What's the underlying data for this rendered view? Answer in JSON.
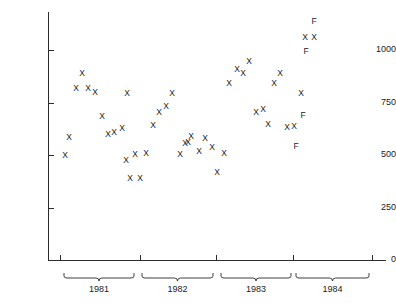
{
  "chart_data": {
    "type": "scatter",
    "title": "",
    "xlabel": "",
    "ylabel": "Monthly sales (millions of dollars)",
    "ylim": [
      0,
      1150
    ],
    "yticks": [
      0,
      250,
      500,
      750,
      1000
    ],
    "ytick_labels": [
      "0",
      "250",
      "500",
      "750",
      "1000"
    ],
    "grid": false,
    "legend": null,
    "x_groups": [
      {
        "label": "1981",
        "start_px": 63,
        "end_px": 135
      },
      {
        "label": "1982",
        "start_px": 141,
        "end_px": 214
      },
      {
        "label": "1983",
        "start_px": 220,
        "end_px": 292
      },
      {
        "label": "1984",
        "start_px": 295,
        "end_px": 370
      }
    ],
    "x_tick_px": [
      60,
      140,
      216,
      293,
      372
    ],
    "marker_symbols": {
      "actual": "X",
      "forecast": "F"
    },
    "points": [
      {
        "px": 65,
        "value": 500,
        "symbol": "X",
        "year": "1981"
      },
      {
        "px": 69,
        "value": 585,
        "symbol": "X",
        "year": "1981"
      },
      {
        "px": 76,
        "value": 820,
        "symbol": "X",
        "year": "1981"
      },
      {
        "px": 82,
        "value": 890,
        "symbol": "X",
        "year": "1981"
      },
      {
        "px": 88,
        "value": 820,
        "symbol": "X",
        "year": "1981"
      },
      {
        "px": 95,
        "value": 800,
        "symbol": "X",
        "year": "1981"
      },
      {
        "px": 102,
        "value": 685,
        "symbol": "X",
        "year": "1981"
      },
      {
        "px": 108,
        "value": 600,
        "symbol": "X",
        "year": "1981"
      },
      {
        "px": 114,
        "value": 610,
        "symbol": "X",
        "year": "1981"
      },
      {
        "px": 122,
        "value": 630,
        "symbol": "X",
        "year": "1981"
      },
      {
        "px": 127,
        "value": 795,
        "symbol": "X",
        "year": "1981"
      },
      {
        "px": 126,
        "value": 475,
        "symbol": "X",
        "year": "1981"
      },
      {
        "px": 130,
        "value": 390,
        "symbol": "X",
        "year": "1981"
      },
      {
        "px": 135,
        "value": 505,
        "symbol": "X",
        "year": "1982"
      },
      {
        "px": 140,
        "value": 390,
        "symbol": "X",
        "year": "1982"
      },
      {
        "px": 146,
        "value": 510,
        "symbol": "X",
        "year": "1982"
      },
      {
        "px": 153,
        "value": 645,
        "symbol": "X",
        "year": "1982"
      },
      {
        "px": 159,
        "value": 705,
        "symbol": "X",
        "year": "1982"
      },
      {
        "px": 166,
        "value": 735,
        "symbol": "X",
        "year": "1982"
      },
      {
        "px": 172,
        "value": 795,
        "symbol": "X",
        "year": "1982"
      },
      {
        "px": 180,
        "value": 505,
        "symbol": "X",
        "year": "1982"
      },
      {
        "px": 185,
        "value": 555,
        "symbol": "X",
        "year": "1982"
      },
      {
        "px": 188,
        "value": 560,
        "symbol": "X",
        "year": "1982"
      },
      {
        "px": 191,
        "value": 590,
        "symbol": "X",
        "year": "1982"
      },
      {
        "px": 199,
        "value": 520,
        "symbol": "X",
        "year": "1982"
      },
      {
        "px": 205,
        "value": 580,
        "symbol": "X",
        "year": "1982"
      },
      {
        "px": 212,
        "value": 540,
        "symbol": "X",
        "year": "1982"
      },
      {
        "px": 217,
        "value": 420,
        "symbol": "X",
        "year": "1983"
      },
      {
        "px": 224,
        "value": 510,
        "symbol": "X",
        "year": "1983"
      },
      {
        "px": 229,
        "value": 845,
        "symbol": "X",
        "year": "1983"
      },
      {
        "px": 237,
        "value": 910,
        "symbol": "X",
        "year": "1983"
      },
      {
        "px": 243,
        "value": 890,
        "symbol": "X",
        "year": "1983"
      },
      {
        "px": 249,
        "value": 950,
        "symbol": "X",
        "year": "1983"
      },
      {
        "px": 256,
        "value": 705,
        "symbol": "X",
        "year": "1983"
      },
      {
        "px": 263,
        "value": 720,
        "symbol": "X",
        "year": "1983"
      },
      {
        "px": 268,
        "value": 650,
        "symbol": "X",
        "year": "1983"
      },
      {
        "px": 274,
        "value": 845,
        "symbol": "X",
        "year": "1983"
      },
      {
        "px": 280,
        "value": 890,
        "symbol": "X",
        "year": "1983"
      },
      {
        "px": 287,
        "value": 635,
        "symbol": "X",
        "year": "1984"
      },
      {
        "px": 294,
        "value": 640,
        "symbol": "X",
        "year": "1984"
      },
      {
        "px": 296,
        "value": 545,
        "symbol": "F",
        "year": "1984"
      },
      {
        "px": 301,
        "value": 795,
        "symbol": "X",
        "year": "1984"
      },
      {
        "px": 303,
        "value": 690,
        "symbol": "F",
        "year": "1984"
      },
      {
        "px": 305,
        "value": 1060,
        "symbol": "X",
        "year": "1984"
      },
      {
        "px": 314,
        "value": 1060,
        "symbol": "X",
        "year": "1984"
      },
      {
        "px": 306,
        "value": 995,
        "symbol": "F",
        "year": "1984"
      },
      {
        "px": 314,
        "value": 1140,
        "symbol": "F",
        "year": "1984"
      }
    ]
  },
  "colors": {
    "axis": "#2b2b2b",
    "text": "#1a1a1a",
    "marker": "#1a1a1a",
    "background": "#ffffff"
  }
}
